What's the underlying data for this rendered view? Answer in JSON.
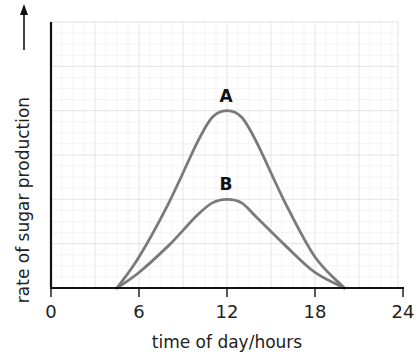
{
  "chart_data": {
    "type": "line",
    "title": "",
    "xlabel": "time of day/hours",
    "ylabel": "rate of sugar production",
    "ylabel_arrow": true,
    "xlim": [
      0,
      24
    ],
    "ylim": [
      0,
      6
    ],
    "x_ticks": [
      0,
      6,
      12,
      18,
      24
    ],
    "x_tick_labels": [
      "0",
      "6",
      "12",
      "18",
      "24"
    ],
    "y_ticks": [],
    "grid": true,
    "legend": null,
    "series": [
      {
        "name": "A",
        "color": "#7a7a7a",
        "x": [
          4.5,
          6,
          8,
          10,
          11,
          12,
          13,
          14,
          16,
          18,
          20
        ],
        "y": [
          0,
          0.7,
          1.9,
          3.3,
          3.85,
          4.0,
          3.85,
          3.3,
          1.9,
          0.7,
          0
        ]
      },
      {
        "name": "B",
        "color": "#7a7a7a",
        "x": [
          4.5,
          6,
          8,
          9,
          10,
          11,
          12,
          13,
          14,
          16,
          18,
          20
        ],
        "y": [
          0,
          0.35,
          0.95,
          1.3,
          1.65,
          1.92,
          2.0,
          1.92,
          1.6,
          0.95,
          0.35,
          0
        ]
      }
    ],
    "annotations": [
      {
        "text": "A",
        "x": 12,
        "y": 4.0
      },
      {
        "text": "B",
        "x": 12,
        "y": 2.0
      }
    ]
  }
}
